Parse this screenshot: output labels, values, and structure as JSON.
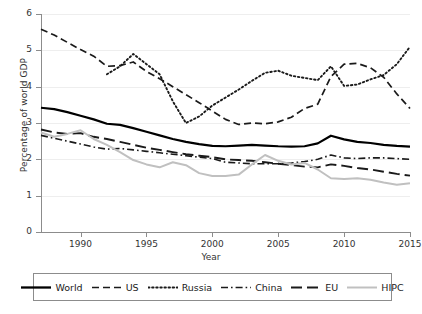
{
  "chart_data": {
    "type": "line",
    "title": "",
    "xlabel": "Year",
    "ylabel": "Percentage of world GDP",
    "xlim": [
      1987,
      2015
    ],
    "ylim": [
      0,
      6
    ],
    "yticks": [
      0,
      1,
      2,
      3,
      4,
      5,
      6
    ],
    "xticks": [
      1990,
      1995,
      2000,
      2005,
      2010,
      2015
    ],
    "grid": "horizontal",
    "legend_position": "below-axes",
    "x": [
      1987,
      1988,
      1989,
      1990,
      1991,
      1992,
      1993,
      1994,
      1995,
      1996,
      1997,
      1998,
      1999,
      2000,
      2001,
      2002,
      2003,
      2004,
      2005,
      2006,
      2007,
      2008,
      2009,
      2010,
      2011,
      2012,
      2013,
      2014,
      2015
    ],
    "series": [
      {
        "name": "World",
        "style": "solid",
        "color": "#000000",
        "values": [
          3.42,
          3.38,
          3.3,
          3.2,
          3.1,
          2.98,
          2.95,
          2.86,
          2.76,
          2.66,
          2.56,
          2.48,
          2.42,
          2.37,
          2.36,
          2.38,
          2.4,
          2.38,
          2.36,
          2.35,
          2.36,
          2.44,
          2.65,
          2.55,
          2.48,
          2.45,
          2.4,
          2.37,
          2.35
        ]
      },
      {
        "name": "US",
        "style": "dashed",
        "color": "#1a1a1a",
        "values": [
          5.58,
          5.42,
          5.22,
          5.02,
          4.84,
          4.56,
          4.58,
          4.68,
          4.42,
          4.22,
          4.0,
          3.78,
          3.56,
          3.33,
          3.1,
          2.96,
          3.0,
          2.98,
          3.03,
          3.16,
          3.4,
          3.52,
          4.28,
          4.62,
          4.64,
          4.52,
          4.26,
          3.8,
          3.4
        ]
      },
      {
        "name": "Russia",
        "style": "dotted",
        "color": "#1a1a1a",
        "values": [
          null,
          null,
          null,
          null,
          null,
          4.34,
          4.56,
          4.9,
          4.62,
          4.34,
          3.6,
          3.0,
          3.18,
          3.48,
          3.7,
          3.92,
          4.16,
          4.38,
          4.44,
          4.3,
          4.24,
          4.18,
          4.56,
          4.02,
          4.06,
          4.2,
          4.32,
          4.62,
          5.1
        ]
      },
      {
        "name": "China",
        "style": "dashdot",
        "color": "#1a1a1a",
        "values": [
          2.66,
          2.58,
          2.5,
          2.42,
          2.34,
          2.28,
          2.3,
          2.26,
          2.22,
          2.18,
          2.14,
          2.1,
          2.06,
          2.02,
          1.92,
          1.9,
          1.88,
          1.88,
          1.88,
          1.9,
          1.94,
          2.0,
          2.12,
          2.04,
          2.02,
          2.04,
          2.04,
          2.02,
          2.0
        ]
      },
      {
        "name": "EU",
        "style": "longdash",
        "color": "#1a1a1a",
        "values": [
          2.82,
          2.74,
          2.7,
          2.72,
          2.62,
          2.56,
          2.48,
          2.4,
          2.32,
          2.26,
          2.2,
          2.14,
          2.1,
          2.06,
          2.0,
          1.98,
          1.96,
          1.92,
          1.88,
          1.84,
          1.8,
          1.78,
          1.86,
          1.82,
          1.76,
          1.72,
          1.66,
          1.6,
          1.55
        ]
      },
      {
        "name": "HIPC",
        "style": "solid",
        "color": "#c0c0c0",
        "values": [
          2.74,
          2.62,
          2.7,
          2.8,
          2.56,
          2.4,
          2.2,
          1.98,
          1.86,
          1.78,
          1.92,
          1.84,
          1.62,
          1.54,
          1.54,
          1.58,
          1.86,
          2.12,
          1.96,
          1.86,
          1.9,
          1.72,
          1.48,
          1.46,
          1.48,
          1.44,
          1.36,
          1.3,
          1.34
        ]
      }
    ]
  },
  "legend": {
    "items": [
      {
        "label": "World"
      },
      {
        "label": "US"
      },
      {
        "label": "Russia"
      },
      {
        "label": "China"
      },
      {
        "label": "EU"
      },
      {
        "label": "HIPC"
      }
    ]
  }
}
